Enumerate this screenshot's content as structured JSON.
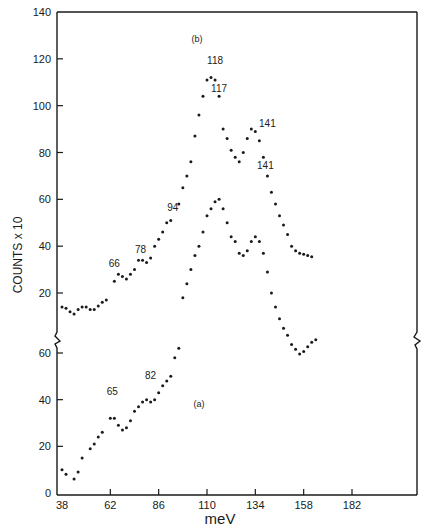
{
  "chart_data": {
    "type": "scatter",
    "title": "",
    "xlabel": "meV",
    "ylabel": "COUNTS x 10",
    "x_ticks": [
      38,
      62,
      86,
      110,
      134,
      158,
      182
    ],
    "xlim": [
      36,
      213
    ],
    "y_axis_broken": true,
    "upper_panel": {
      "ylim": [
        12,
        140
      ],
      "y_ticks": [
        20,
        40,
        60,
        80,
        100,
        120,
        140
      ]
    },
    "lower_panel": {
      "ylim": [
        0,
        62
      ],
      "y_ticks": [
        0,
        20,
        40,
        60
      ]
    },
    "grid": false,
    "legend": "none",
    "series": [
      {
        "name": "(b)",
        "panel": "upper",
        "peak_labels": [
          {
            "text": "66",
            "x": 64,
            "y": 31
          },
          {
            "text": "78",
            "x": 77,
            "y": 37
          },
          {
            "text": "94",
            "x": 93,
            "y": 55
          },
          {
            "text": "118",
            "x": 114,
            "y": 118
          },
          {
            "text": "141",
            "x": 140,
            "y": 91
          }
        ],
        "panel_label": {
          "text": "(b)",
          "x": 105,
          "y": 127
        },
        "points": [
          [
            38,
            14
          ],
          [
            40,
            13.5
          ],
          [
            42,
            12
          ],
          [
            44,
            11
          ],
          [
            46,
            13
          ],
          [
            48,
            14
          ],
          [
            50,
            14
          ],
          [
            52,
            13
          ],
          [
            54,
            13
          ],
          [
            56,
            14.5
          ],
          [
            58,
            16
          ],
          [
            60,
            17
          ],
          [
            64,
            25
          ],
          [
            66,
            28
          ],
          [
            68,
            27
          ],
          [
            70,
            26
          ],
          [
            72,
            28
          ],
          [
            74,
            30
          ],
          [
            76,
            34
          ],
          [
            78,
            34
          ],
          [
            80,
            33
          ],
          [
            82,
            35
          ],
          [
            84,
            40
          ],
          [
            86,
            43
          ],
          [
            88,
            46
          ],
          [
            90,
            50
          ],
          [
            92,
            51
          ],
          [
            96,
            58
          ],
          [
            98,
            65
          ],
          [
            100,
            70
          ],
          [
            102,
            76
          ],
          [
            104,
            87
          ],
          [
            106,
            96
          ],
          [
            108,
            104
          ],
          [
            110,
            111
          ],
          [
            112,
            112
          ],
          [
            114,
            111
          ],
          [
            116,
            104
          ],
          [
            118,
            90
          ],
          [
            120,
            86
          ],
          [
            122,
            81
          ],
          [
            124,
            78
          ],
          [
            126,
            76
          ],
          [
            128,
            80
          ],
          [
            130,
            86
          ],
          [
            132,
            90
          ],
          [
            134,
            89
          ],
          [
            136,
            85
          ],
          [
            138,
            78
          ],
          [
            140,
            70
          ],
          [
            142,
            63
          ],
          [
            144,
            58
          ],
          [
            146,
            53
          ],
          [
            148,
            49
          ],
          [
            150,
            45
          ],
          [
            152,
            40
          ],
          [
            154,
            38
          ],
          [
            156,
            37
          ],
          [
            158,
            36.5
          ],
          [
            160,
            36
          ],
          [
            162,
            35.5
          ]
        ]
      },
      {
        "name": "(a)",
        "panel": "lower",
        "peak_labels": [
          {
            "text": "65",
            "x": 63,
            "y": 42
          },
          {
            "text": "82",
            "x": 82,
            "y": 49
          },
          {
            "text": "117",
            "x": 116,
            "y": 106
          },
          {
            "text": "141",
            "x": 139,
            "y": 73
          }
        ],
        "panel_label": {
          "text": "(a)",
          "x": 106,
          "y": 37
        },
        "points": [
          [
            38,
            10
          ],
          [
            40,
            8
          ],
          [
            44,
            6
          ],
          [
            46,
            9
          ],
          [
            48,
            15
          ],
          [
            52,
            19
          ],
          [
            54,
            21
          ],
          [
            56,
            24
          ],
          [
            58,
            26
          ],
          [
            62,
            32
          ],
          [
            64,
            32
          ],
          [
            66,
            29
          ],
          [
            68,
            27
          ],
          [
            70,
            28
          ],
          [
            72,
            31
          ],
          [
            74,
            35
          ],
          [
            76,
            37
          ],
          [
            78,
            39
          ],
          [
            80,
            40
          ],
          [
            82,
            39
          ],
          [
            84,
            40
          ],
          [
            86,
            43
          ],
          [
            88,
            46
          ],
          [
            90,
            48
          ],
          [
            92,
            50
          ],
          [
            94,
            58
          ],
          [
            96,
            62
          ]
        ],
        "points_upper_scale": [
          [
            98,
            18
          ],
          [
            100,
            24
          ],
          [
            102,
            30
          ],
          [
            104,
            36
          ],
          [
            106,
            40
          ],
          [
            108,
            46
          ],
          [
            110,
            53
          ],
          [
            112,
            56
          ],
          [
            114,
            59
          ],
          [
            116,
            60
          ],
          [
            118,
            56
          ],
          [
            120,
            50
          ],
          [
            122,
            44
          ],
          [
            124,
            42
          ],
          [
            126,
            37
          ],
          [
            128,
            36
          ],
          [
            130,
            38
          ],
          [
            132,
            42
          ],
          [
            134,
            44
          ],
          [
            136,
            42
          ],
          [
            138,
            37
          ],
          [
            140,
            29
          ],
          [
            142,
            20
          ],
          [
            144,
            14
          ],
          [
            146,
            9
          ],
          [
            148,
            5
          ],
          [
            150,
            2
          ],
          [
            152,
            -2
          ],
          [
            154,
            -4
          ],
          [
            156,
            -6
          ],
          [
            158,
            -5
          ],
          [
            160,
            -3
          ],
          [
            162,
            -1
          ],
          [
            164,
            0
          ]
        ]
      }
    ]
  }
}
